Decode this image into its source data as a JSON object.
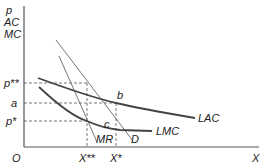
{
  "diagram": {
    "type": "economics-cost-revenue",
    "y_axis_labels": [
      "p",
      "AC",
      "MC"
    ],
    "x_axis_label": "X",
    "origin_label": "O",
    "price_levels": [
      {
        "label": "p**",
        "y": 83
      },
      {
        "label": "a",
        "y": 103
      },
      {
        "label": "p*",
        "y": 121
      }
    ],
    "quantity_levels": [
      {
        "label": "X**",
        "x": 87
      },
      {
        "label": "X*",
        "x": 116
      }
    ],
    "points": [
      {
        "label": "b",
        "x": 116,
        "y": 103
      },
      {
        "label": "c",
        "x": 110,
        "y": 129
      }
    ],
    "curves": [
      {
        "label": "LAC",
        "kind": "long-run average cost"
      },
      {
        "label": "LMC",
        "kind": "long-run marginal cost"
      },
      {
        "label": "D",
        "kind": "demand"
      },
      {
        "label": "MR",
        "kind": "marginal revenue"
      }
    ]
  }
}
